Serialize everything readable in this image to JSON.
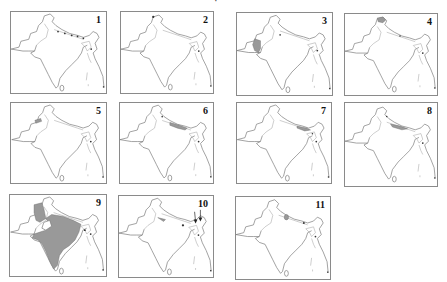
{
  "figure": {
    "title_partial": "·",
    "panels": [
      {
        "number": "1",
        "highlight": "himalayan-foothills-dots"
      },
      {
        "number": "2",
        "highlight": "northwest-tip"
      },
      {
        "number": "3",
        "highlight": "indus-delta-sindh"
      },
      {
        "number": "4",
        "highlight": "kashmir"
      },
      {
        "number": "5",
        "highlight": "punjab-patch"
      },
      {
        "number": "6",
        "highlight": "central-himalaya"
      },
      {
        "number": "7",
        "highlight": "eastern-himalaya"
      },
      {
        "number": "8",
        "highlight": "nepal-himalaya"
      },
      {
        "number": "9",
        "highlight": "widespread-peninsular"
      },
      {
        "number": "10",
        "highlight": "northeast-arrows"
      },
      {
        "number": "11",
        "highlight": "western-himalaya-spot"
      }
    ]
  },
  "colors": {
    "outline": "#777777",
    "shade": "#999999",
    "panel_border": "#8a8a8a"
  }
}
